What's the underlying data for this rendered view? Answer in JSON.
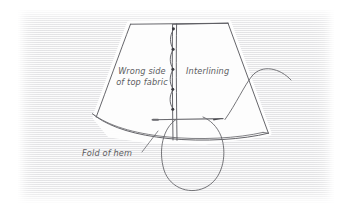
{
  "illustration": {
    "kind": "hand-drawn sewing diagram",
    "subject": "attaching interlining to the wrong side of top fabric above the fold of hem",
    "background_color": "#ffffff",
    "paper_color": "#e9e9eb",
    "ink_color": "#5a5a5f",
    "fabric_fill": "#fdfdfd"
  },
  "labels": {
    "wrong_side": "Wrong side\nof top fabric",
    "interlining": "Interlining",
    "fold_of_hem": "Fold of hem"
  },
  "elements": {
    "fabric_panel": "garment panel, trapezoid with curved hem",
    "interlining_strip": "interlining piece on right of vertical seam",
    "basting_stitches": "chain of loop stitches along vertical seam",
    "needle": "sewing needle passing horizontally through fabric",
    "thread": "thread curving up to the right with a hanging loop below",
    "hem_fold_lines": "double curved line at lower left edge",
    "leader_line": "pointer from 'Fold of hem' text to the hem"
  }
}
